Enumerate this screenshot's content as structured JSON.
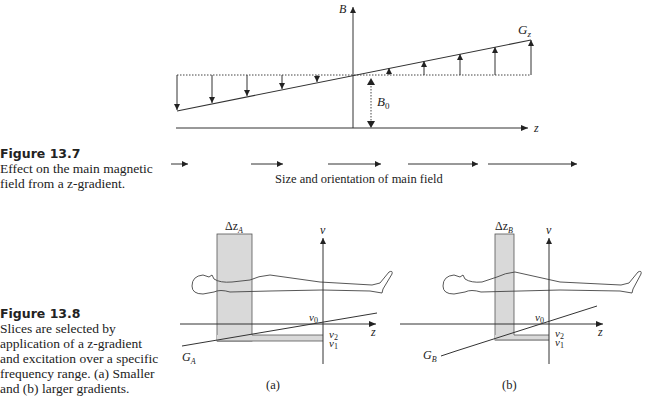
{
  "figure_13_7": {
    "title": "Figure 13.7",
    "caption": "Effect on the main magnetic field from a z-gradient.",
    "caption_lines": [
      "Effect on the main magnetic",
      "field from a z-gradient."
    ],
    "axis_labels": {
      "vertical": "B",
      "horizontal": "z"
    },
    "gradient_label": "G",
    "gradient_sub": "z",
    "offset_label": "B",
    "offset_sub": "0",
    "legend_text": "Size and orientation of main field"
  },
  "figure_13_8": {
    "title": "Figure 13.8",
    "caption_lines": [
      "Slices are selected by",
      "application of a z-gradient",
      "and excitation over a specific",
      "frequency range. (a) Smaller",
      "and (b) larger gradients."
    ],
    "panel_a": {
      "label": "(a)",
      "slice_label": "Δz",
      "slice_sub": "A",
      "gradient_label": "G",
      "gradient_sub": "A",
      "freq_axis": "ν",
      "z_axis": "z",
      "nu0": "ν",
      "nu0_sub": "0",
      "nu1": "ν",
      "nu1_sub": "1",
      "nu2": "ν",
      "nu2_sub": "2"
    },
    "panel_b": {
      "label": "(b)",
      "slice_label": "Δz",
      "slice_sub": "B",
      "gradient_label": "G",
      "gradient_sub": "B",
      "freq_axis": "ν",
      "z_axis": "z",
      "nu0": "ν",
      "nu0_sub": "0",
      "nu1": "ν",
      "nu1_sub": "1",
      "nu2": "ν",
      "nu2_sub": "2"
    }
  }
}
